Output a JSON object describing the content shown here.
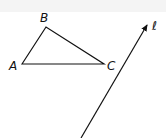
{
  "diagram": {
    "triangle": {
      "vertices": [
        {
          "label": "A",
          "x": 22,
          "y": 64
        },
        {
          "label": "B",
          "x": 46,
          "y": 27
        },
        {
          "label": "C",
          "x": 104,
          "y": 64
        }
      ]
    },
    "line": {
      "label": "ℓ",
      "start": {
        "x": 81,
        "y": 138
      },
      "end": {
        "x": 148,
        "y": 24
      },
      "arrow_at": "end"
    },
    "stroke_color": "#111111"
  }
}
